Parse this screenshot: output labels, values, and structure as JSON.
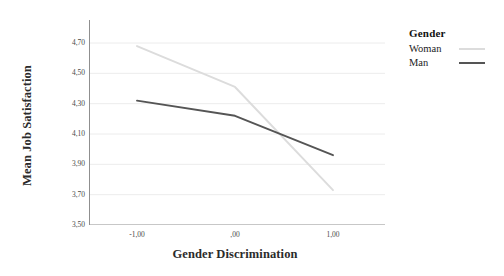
{
  "chart_data": {
    "type": "line",
    "title": "",
    "subtitle": "",
    "xlabel": "Gender Discrimination",
    "ylabel": "Mean Job Satisfaction",
    "x": [
      -1.0,
      0.0,
      1.0
    ],
    "categories": [
      "-1,00",
      ",00",
      "1,00"
    ],
    "xlim": [
      -1.35,
      1.35
    ],
    "ylim": [
      3.5,
      4.8
    ],
    "ytick_values": [
      4.7,
      4.5,
      4.3,
      4.1,
      3.9,
      3.7,
      3.5
    ],
    "ytick_labels": [
      "4,70",
      "4,50",
      "4,30",
      "4,10",
      "3,90",
      "3,70",
      "3,50"
    ],
    "grid": true,
    "grid_axis": "y",
    "legend_position": "right",
    "legend_title": "Gender",
    "series": [
      {
        "name": "Woman",
        "color": "#dcdcdc",
        "values": [
          4.68,
          4.41,
          3.73
        ]
      },
      {
        "name": "Man",
        "color": "#555555",
        "values": [
          4.32,
          4.22,
          3.96
        ]
      }
    ]
  },
  "axes": {
    "y_title": "Mean Job Satisfaction",
    "x_title": "Gender Discrimination",
    "y_ticks": [
      {
        "label": "4,70",
        "value": 4.7
      },
      {
        "label": "4,50",
        "value": 4.5
      },
      {
        "label": "4,30",
        "value": 4.3
      },
      {
        "label": "4,10",
        "value": 4.1
      },
      {
        "label": "3,90",
        "value": 3.9
      },
      {
        "label": "3,70",
        "value": 3.7
      },
      {
        "label": "3,50",
        "value": 3.5
      }
    ],
    "x_ticks": [
      {
        "label": "-1,00",
        "value": -1.0
      },
      {
        "label": ",00",
        "value": 0.0
      },
      {
        "label": "1,00",
        "value": 1.0
      }
    ]
  },
  "legend": {
    "title": "Gender",
    "entries": [
      {
        "label": "Woman",
        "color": "#dcdcdc"
      },
      {
        "label": "Man",
        "color": "#555555"
      }
    ]
  },
  "colors": {
    "axis": "#8f8f8f",
    "grid": "#ececec",
    "text": "#1c1c1c",
    "tick_text": "#4a4a4a",
    "woman_line": "#dcdcdc",
    "man_line": "#555555",
    "background": "#ffffff"
  }
}
